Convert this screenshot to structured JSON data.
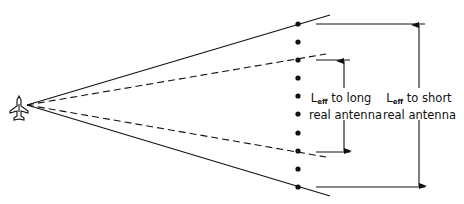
{
  "diagram": {
    "type": "radar-beam-geometry",
    "source_icon": "aircraft-icon",
    "element_count": 10,
    "labels": {
      "long": {
        "symbol": "L",
        "subscript": "eff",
        "line1_rest": " to long",
        "line2": "real antenna"
      },
      "short": {
        "symbol": "L",
        "subscript": "eff",
        "line1_rest": " to short",
        "line2": "real antenna"
      }
    },
    "colors": {
      "line": "#111111",
      "background": "#ffffff"
    }
  }
}
